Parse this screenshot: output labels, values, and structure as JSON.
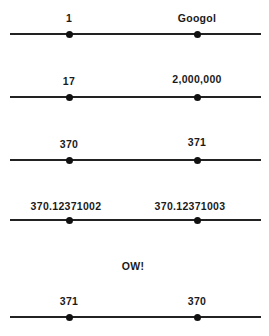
{
  "lines": [
    {
      "y": 34,
      "left_label": "1",
      "right_label": "Googol"
    },
    {
      "y": 97,
      "left_label": "17",
      "right_label": "2,000,000"
    },
    {
      "y": 160,
      "left_label": "370",
      "right_label": "371"
    },
    {
      "y": 220,
      "left_label": "370.12371002",
      "right_label": "370.12371003"
    },
    {
      "y": 317,
      "left_label": "371",
      "right_label": "370"
    }
  ],
  "note": "OW!",
  "points": {
    "left_x": 69,
    "right_x": 197
  }
}
